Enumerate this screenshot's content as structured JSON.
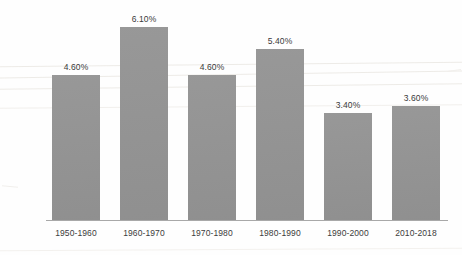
{
  "chart_data": {
    "type": "bar",
    "title": "",
    "subtitle": "",
    "xlabel": "",
    "ylabel": "",
    "categories": [
      "1950-1960",
      "1960-1970",
      "1970-1980",
      "1980-1990",
      "1990-2000",
      "2010-2018"
    ],
    "values": [
      4.6,
      6.1,
      4.6,
      5.4,
      3.4,
      3.6
    ],
    "value_labels": [
      "4.60%",
      "6.10%",
      "4.60%",
      "5.40%",
      "3.40%",
      "3.60%"
    ],
    "unit": "%",
    "ylim": [
      0,
      6.9
    ],
    "grid": false,
    "legend": null,
    "legend_position": "none",
    "axis_visible": {
      "x": true,
      "y": false
    },
    "series": [
      {
        "name": "",
        "values": [
          4.6,
          6.1,
          4.6,
          5.4,
          3.4,
          3.6
        ],
        "color": "#939393"
      }
    ],
    "colors": {
      "bar_fill": "#939393",
      "value_text": "#3a3a3a",
      "tick_text": "#3c3c3c",
      "axis_line": "#a8a8a8",
      "background": "#fefefe"
    }
  }
}
